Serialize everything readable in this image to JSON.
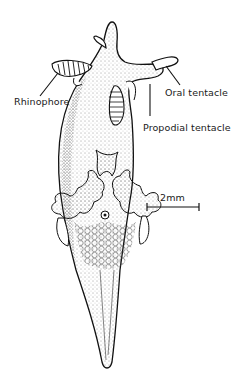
{
  "figure": {
    "labels": {
      "rhinophore": "Rhinophore",
      "oral_tentacle": "Oral tentacle",
      "propodial_tentacle": "Propodial tentacle"
    },
    "scale_bar": {
      "label": "2mm",
      "length_px": 52
    },
    "colors": {
      "ink": "#1a1a1a",
      "background": "#ffffff"
    }
  }
}
